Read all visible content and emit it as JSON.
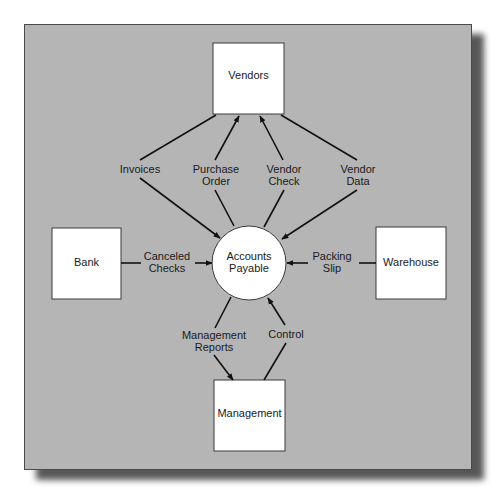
{
  "diagram": {
    "type": "data-flow-diagram",
    "colors": {
      "panel_background": "#b5b5b5",
      "node_fill": "#ffffff",
      "line": "#111111",
      "text": "#1a1a1a"
    },
    "process": {
      "id": "accounts-payable",
      "shape": "circle",
      "label_lines": [
        "Accounts",
        "Payable"
      ]
    },
    "entities": [
      {
        "id": "vendors",
        "shape": "rect",
        "label": "Vendors"
      },
      {
        "id": "bank",
        "shape": "rect",
        "label": "Bank"
      },
      {
        "id": "warehouse",
        "shape": "rect",
        "label": "Warehouse"
      },
      {
        "id": "management",
        "shape": "rect",
        "label": "Management"
      }
    ],
    "flows": [
      {
        "id": "invoices",
        "label_lines": [
          "Invoices"
        ],
        "from": "vendors",
        "to": "accounts-payable"
      },
      {
        "id": "purchase-order",
        "label_lines": [
          "Purchase",
          "Order"
        ],
        "from": "accounts-payable",
        "to": "vendors"
      },
      {
        "id": "vendor-check",
        "label_lines": [
          "Vendor",
          "Check"
        ],
        "from": "accounts-payable",
        "to": "vendors"
      },
      {
        "id": "vendor-data",
        "label_lines": [
          "Vendor",
          "Data"
        ],
        "from": "vendors",
        "to": "accounts-payable"
      },
      {
        "id": "canceled-checks",
        "label_lines": [
          "Canceled",
          "Checks"
        ],
        "from": "bank",
        "to": "accounts-payable"
      },
      {
        "id": "packing-slip",
        "label_lines": [
          "Packing",
          "Slip"
        ],
        "from": "warehouse",
        "to": "accounts-payable"
      },
      {
        "id": "management-reports",
        "label_lines": [
          "Management",
          "Reports"
        ],
        "from": "accounts-payable",
        "to": "management"
      },
      {
        "id": "control",
        "label_lines": [
          "Control"
        ],
        "from": "management",
        "to": "accounts-payable"
      }
    ]
  }
}
